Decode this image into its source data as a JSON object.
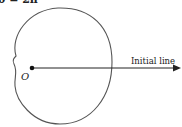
{
  "header_text": "θ = 2π",
  "diagram": {
    "pole_label": "O",
    "initial_line_label": "Initial line",
    "curve_color": "#555555",
    "line_color": "#222222"
  }
}
